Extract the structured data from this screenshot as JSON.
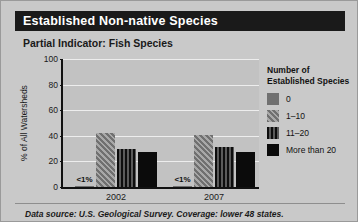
{
  "header": {
    "title": "Established Non-native Species",
    "subtitle": "Partial Indicator: Fish Species"
  },
  "footer": {
    "note": "Data source: U.S. Geological Survey. Coverage: lower 48 states."
  },
  "legend": {
    "title": "Number of\nEstablished Species",
    "items": [
      {
        "label": "0",
        "swatch": "solid-gray",
        "color": "#707070"
      },
      {
        "label": "1–10",
        "swatch": "diagonal-hatch",
        "color": "#8a8a8a"
      },
      {
        "label": "11–20",
        "swatch": "vertical-stripe",
        "color": "#0d0d0d"
      },
      {
        "label": "More than 20",
        "swatch": "solid-black",
        "color": "#0b0b0b"
      }
    ]
  },
  "chart_data": {
    "type": "bar",
    "title": "Partial Indicator: Fish Species",
    "xlabel": "",
    "ylabel": "% of All Watersheds",
    "ylim": [
      0,
      100
    ],
    "yticks": [
      0,
      20,
      40,
      60,
      80,
      100
    ],
    "grid": true,
    "legend_position": "right",
    "categories": [
      "2002",
      "2007"
    ],
    "series": [
      {
        "name": "0",
        "values": [
          0.5,
          0.5
        ],
        "value_labels": [
          "<1%",
          "<1%"
        ],
        "pattern": "solid-gray"
      },
      {
        "name": "1–10",
        "values": [
          42,
          41
        ],
        "value_labels": [
          "",
          ""
        ],
        "pattern": "diagonal-hatch"
      },
      {
        "name": "11–20",
        "values": [
          30,
          31
        ],
        "value_labels": [
          "",
          ""
        ],
        "pattern": "vertical-stripe"
      },
      {
        "name": "More than 20",
        "values": [
          27,
          27
        ],
        "value_labels": [
          "",
          ""
        ],
        "pattern": "solid-black"
      }
    ]
  }
}
